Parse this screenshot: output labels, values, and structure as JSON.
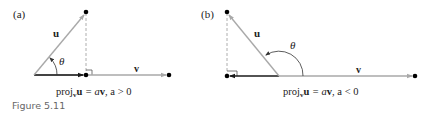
{
  "figure": {
    "caption": "Figure 5.11",
    "colors": {
      "vector": "#a9a9a9",
      "projection": "#1a1a1a",
      "dot": "#000000",
      "dashed": "#999999",
      "caption": "#666666"
    },
    "panels": [
      {
        "label": "(a)",
        "u_label": "u",
        "v_label": "v",
        "angle_label": "θ",
        "formula_pre": "proj",
        "formula_sub": "v",
        "formula_bold_u": "u",
        "formula_rest": " = a",
        "formula_v": "v",
        "formula_cond": ", a > 0"
      },
      {
        "label": "(b)",
        "u_label": "u",
        "v_label": "v",
        "angle_label": "θ",
        "formula_pre": "proj",
        "formula_sub": "v",
        "formula_bold_u": "u",
        "formula_rest": " = a",
        "formula_v": "v",
        "formula_cond": ", a < 0"
      }
    ]
  }
}
